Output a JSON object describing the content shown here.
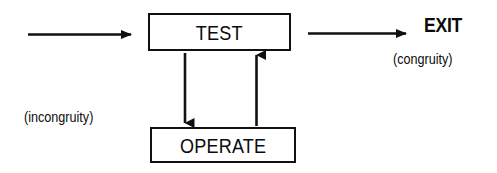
{
  "figure": {
    "kind": "flow-diagram",
    "title_visible": false,
    "background_color": "#ffffff",
    "ink_color": "#111111",
    "width": 497,
    "height": 173
  },
  "nodes": [
    {
      "id": "test",
      "label": "TEST",
      "shape": "rectangle"
    },
    {
      "id": "operate",
      "label": "OPERATE",
      "shape": "rectangle"
    }
  ],
  "terminals": [
    {
      "id": "exit",
      "label": "EXIT"
    }
  ],
  "edges": [
    {
      "id": "input-to-test",
      "label": "(incongruity)",
      "direction": "right",
      "from": "input",
      "to": "test"
    },
    {
      "id": "test-to-exit",
      "label": "(congruity)",
      "direction": "right",
      "from": "test",
      "to": "exit"
    },
    {
      "id": "test-to-operate",
      "label": "",
      "direction": "down",
      "from": "test",
      "to": "operate"
    },
    {
      "id": "operate-to-test",
      "label": "",
      "direction": "up",
      "from": "operate",
      "to": "test"
    }
  ],
  "boxes": {
    "test": {
      "label": "TEST"
    },
    "operate": {
      "label": "OPERATE"
    }
  },
  "labels": {
    "exit": "EXIT",
    "congruity": "(congruity)",
    "incongruity": "(incongruity)"
  }
}
